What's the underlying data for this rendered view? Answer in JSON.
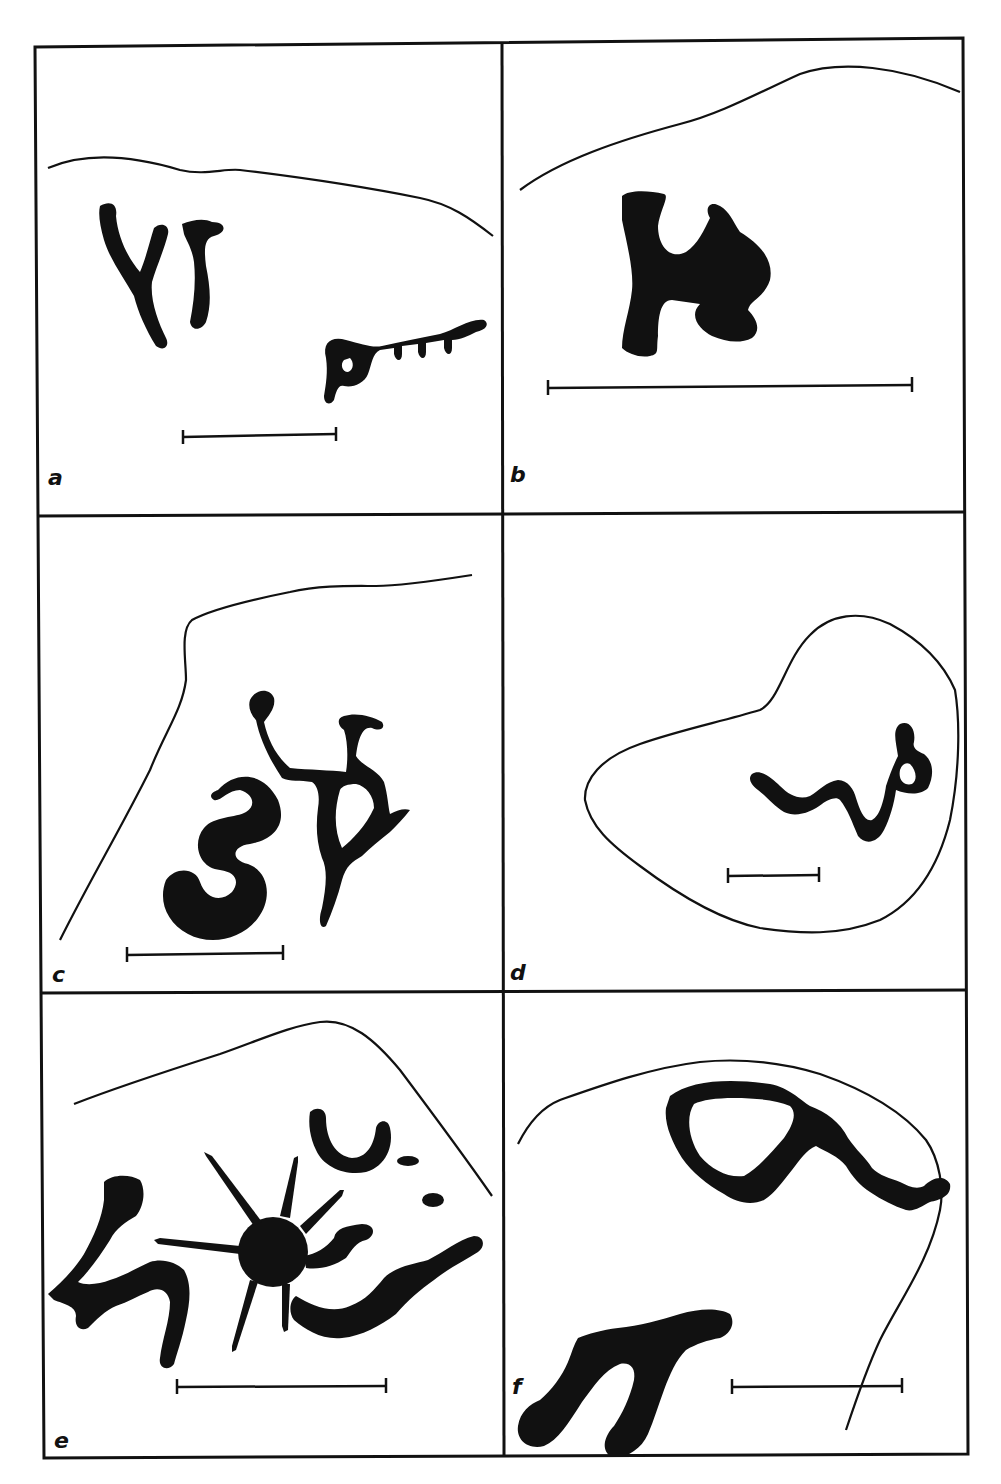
{
  "figure": {
    "layout": {
      "rows": 3,
      "columns": 2
    },
    "colors": {
      "ink": "#111111",
      "paper": "#ffffff"
    },
    "panels": [
      {
        "id": "a",
        "label": "a",
        "content": "two forked/anthropomorphic signs and a comb-like animal figure below rock outline",
        "scale_bar": true
      },
      {
        "id": "b",
        "label": "b",
        "content": "solid H-shaped anthropomorph/animal figure below rock outline",
        "scale_bar": true
      },
      {
        "id": "c",
        "label": "c",
        "content": "serpentine S-shaped figure and a stick figure with raised arm",
        "scale_bar": true
      },
      {
        "id": "d",
        "label": "d",
        "content": "wavy serpentine figure with looped head inside closed rock outline",
        "scale_bar": true
      },
      {
        "id": "e",
        "label": "e",
        "content": "rayed sun-like disc, crescent, dots and curving lines",
        "scale_bar": true
      },
      {
        "id": "f",
        "label": "f",
        "content": "loop with trailing tail and a forked (Y-shaped) figure",
        "scale_bar": true
      }
    ]
  }
}
